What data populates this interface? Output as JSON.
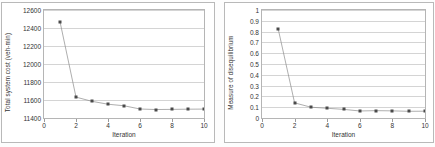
{
  "figure": {
    "background": "#ffffff",
    "marker_color": "#4a4a4a",
    "line_color": "#8b8b8b",
    "grid_color": "#d4d4d4"
  },
  "chart_data": [
    {
      "id": "total-system-cost",
      "type": "line",
      "title": "",
      "xlabel": "Iteration",
      "ylabel": "Total system cost (veh-min)",
      "x": [
        1,
        2,
        3,
        4,
        5,
        6,
        7,
        8,
        9,
        10
      ],
      "values": [
        12470,
        11632,
        11585,
        11553,
        11536,
        11500,
        11494,
        11496,
        11498,
        11499
      ],
      "xlim": [
        0,
        10
      ],
      "ylim": [
        11400,
        12600
      ],
      "xticks": [
        0,
        2,
        4,
        6,
        8,
        10
      ],
      "xticklabels": [
        "0",
        "2",
        "4",
        "6",
        "8",
        "10"
      ],
      "yticks": [
        11400,
        11600,
        11800,
        12000,
        12200,
        12400,
        12600
      ],
      "yticklabels": [
        "11400",
        "11600",
        "11800",
        "12000",
        "12200",
        "12400",
        "12600"
      ],
      "grid": true,
      "legend": false,
      "marker": "square"
    },
    {
      "id": "measure-of-disequilibrium",
      "type": "line",
      "title": "",
      "xlabel": "Iteration",
      "ylabel": "Measure of disequilibrium",
      "x": [
        1,
        2,
        3,
        4,
        5,
        6,
        7,
        8,
        9,
        10
      ],
      "values": [
        0.82,
        0.14,
        0.1,
        0.09,
        0.08,
        0.065,
        0.068,
        0.066,
        0.062,
        0.063
      ],
      "xlim": [
        0,
        10
      ],
      "ylim": [
        0,
        1
      ],
      "xticks": [
        0,
        2,
        4,
        6,
        8,
        10
      ],
      "xticklabels": [
        "0",
        "2",
        "4",
        "6",
        "8",
        "10"
      ],
      "yticks": [
        0,
        0.1,
        0.2,
        0.3,
        0.4,
        0.5,
        0.6,
        0.7,
        0.8,
        0.9,
        1
      ],
      "yticklabels": [
        "0",
        "0.1",
        "0.2",
        "0.3",
        "0.4",
        "0.5",
        "0.6",
        "0.7",
        "0.8",
        "0.9",
        "1"
      ],
      "grid": true,
      "legend": false,
      "marker": "square"
    }
  ]
}
